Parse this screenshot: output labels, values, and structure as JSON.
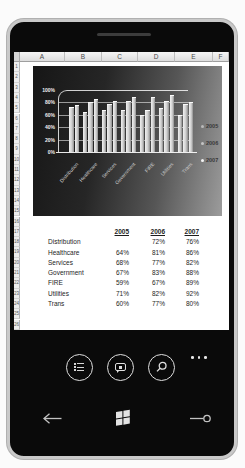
{
  "colors": {
    "frame_silver": "#c9c9c9",
    "bezel_black": "#0a0a0a",
    "screen_white": "#ffffff",
    "chart_bg_dark": "#161616",
    "chart_bg_light": "#9c9c9c",
    "bar_fill": "#d9d9d9",
    "legend_marker_2007": "#f4f4f4"
  },
  "sheet": {
    "column_headers": [
      "A",
      "B",
      "C",
      "D",
      "E",
      "F"
    ],
    "row_numbers": [
      "1",
      "2",
      "3",
      "4",
      "5",
      "6",
      "7",
      "8",
      "9",
      "10",
      "11",
      "12",
      "13",
      "14",
      "15",
      "16",
      "17",
      "18",
      "19",
      "20",
      "21",
      "22",
      "23",
      "24",
      "25",
      "26"
    ]
  },
  "table": {
    "year_headers": [
      "2005",
      "2006",
      "2007"
    ],
    "rows": [
      {
        "label": "Distribution",
        "values": [
          "",
          "72%",
          "76%"
        ]
      },
      {
        "label": "Healthcare",
        "values": [
          "64%",
          "81%",
          "86%"
        ]
      },
      {
        "label": "Services",
        "values": [
          "68%",
          "77%",
          "82%"
        ]
      },
      {
        "label": "Government",
        "values": [
          "67%",
          "83%",
          "88%"
        ]
      },
      {
        "label": "FIRE",
        "values": [
          "59%",
          "67%",
          "89%"
        ]
      },
      {
        "label": "Utilities",
        "values": [
          "71%",
          "82%",
          "92%"
        ]
      },
      {
        "label": "Trans",
        "values": [
          "60%",
          "77%",
          "80%"
        ]
      }
    ]
  },
  "chart_data": {
    "type": "bar",
    "style": "3d-clustered-column-dark-background",
    "categories": [
      "Distribution",
      "Healthcare",
      "Services",
      "Government",
      "FIRE",
      "Utilities",
      "Trans"
    ],
    "series": [
      {
        "name": "2005",
        "values": [
          null,
          64,
          68,
          67,
          59,
          71,
          60
        ]
      },
      {
        "name": "2006",
        "values": [
          72,
          81,
          77,
          83,
          67,
          82,
          77
        ]
      },
      {
        "name": "2007",
        "values": [
          76,
          86,
          82,
          88,
          89,
          92,
          80
        ]
      }
    ],
    "y_ticks": [
      "100%",
      "80%",
      "60%",
      "40%",
      "20%",
      "0%"
    ],
    "ylim": [
      0,
      100
    ],
    "grid": true,
    "legend_position": "right",
    "legend_entries": [
      "2005",
      "2006",
      "2007"
    ]
  },
  "appbar": {
    "buttons": [
      {
        "icon": "outline-notes-icon"
      },
      {
        "icon": "comment-icon"
      },
      {
        "icon": "search-icon"
      }
    ],
    "more_ellipsis": "..."
  },
  "hardware": {
    "buttons": [
      {
        "icon": "back-arrow-icon"
      },
      {
        "icon": "windows-logo-icon"
      },
      {
        "icon": "search-hardware-icon"
      }
    ]
  }
}
